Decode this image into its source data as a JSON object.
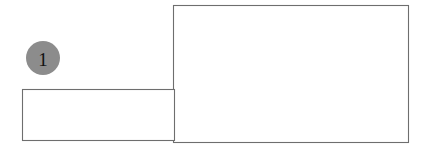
{
  "canvas": {
    "width": 434,
    "height": 149,
    "background_color": "#ffffff"
  },
  "style": {
    "outline_color": "#6e6e6e",
    "outline_width": 1.1,
    "shape_fill": "#ffffff",
    "callout_fill": "#8c8c8c",
    "callout_text_color": "#111111"
  },
  "diagram": {
    "title": "",
    "shapes": [
      {
        "name": "large-rectangle",
        "label": "",
        "x": 173,
        "y": 5,
        "width": 236,
        "height": 138
      },
      {
        "name": "small-rectangle",
        "label": "",
        "x": 22,
        "y": 89,
        "width": 153,
        "height": 52
      }
    ],
    "callouts": [
      {
        "name": "callout-1",
        "label": "1",
        "cx": 43,
        "cy": 58,
        "r": 17
      }
    ]
  }
}
